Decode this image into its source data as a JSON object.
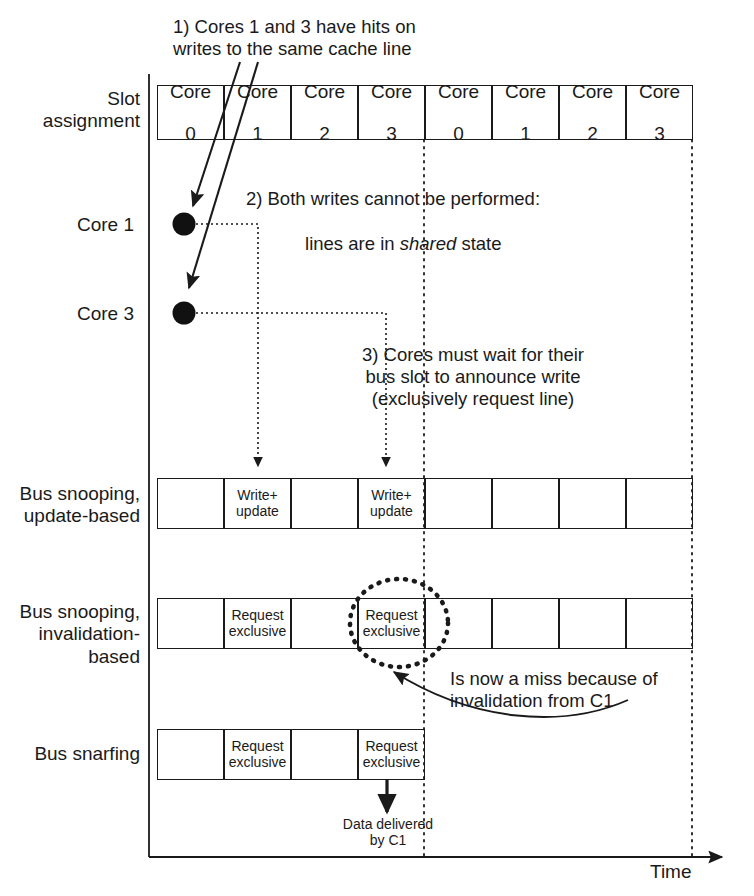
{
  "diagram": {
    "title_axis": "Time",
    "row_labels": {
      "slot_assignment": "Slot\nassignment",
      "core1": "Core 1",
      "core3": "Core 3",
      "snoop_update": "Bus snooping,\nupdate-based",
      "snoop_invalidate": "Bus snooping,\ninvalidation-\nbased",
      "snarfing": "Bus snarfing"
    },
    "slot_row": {
      "cells": [
        {
          "line1": "Core",
          "line2": "0"
        },
        {
          "line1": "Core",
          "line2": "1"
        },
        {
          "line1": "Core",
          "line2": "2"
        },
        {
          "line1": "Core",
          "line2": "3"
        },
        {
          "line1": "Core",
          "line2": "0"
        },
        {
          "line1": "Core",
          "line2": "1"
        },
        {
          "line1": "Core",
          "line2": "2"
        },
        {
          "line1": "Core",
          "line2": "3"
        }
      ]
    },
    "snoop_update_row": {
      "cells": [
        "",
        "Write+\nupdate",
        "",
        "Write+\nupdate",
        "",
        "",
        "",
        ""
      ]
    },
    "snoop_invalidate_row": {
      "cells": [
        "",
        "Request\nexclusive",
        "",
        "Request\nexclusive",
        "",
        "",
        "",
        ""
      ]
    },
    "snarfing_row": {
      "cells": [
        "",
        "Request\nexclusive",
        "",
        "Request\nexclusive"
      ]
    },
    "annotations": {
      "note1": "1) Cores 1 and 3 have hits on\nwrites to the same cache line",
      "note2_line1": "2) Both writes cannot be performed:",
      "note2_line2_a": "lines are in ",
      "note2_line2_italic": "shared",
      "note2_line2_b": " state",
      "note3": "3) Cores must wait for their\nbus slot to announce write\n(exclusively request line)",
      "note4": "Is now a miss because of\ninvalidation from C1",
      "note5": "Data delivered\nby C1"
    },
    "colors": {
      "ink": "#1a1a1a",
      "dot": "#111111",
      "background": "#ffffff"
    }
  }
}
